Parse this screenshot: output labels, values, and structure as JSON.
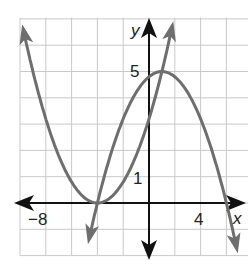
{
  "chart_data": {
    "type": "line",
    "title": "",
    "xlabel": "x",
    "ylabel": "y",
    "xlim": [
      -10,
      7.8
    ],
    "ylim": [
      -2,
      7.2
    ],
    "grid": true,
    "x_grid_step": 2,
    "y_grid_step": 1,
    "tick_labels": {
      "x": [
        {
          "value": -8,
          "label": "−8"
        },
        {
          "value": 4,
          "label": "4"
        }
      ],
      "y": [
        {
          "value": 1,
          "label": "1"
        },
        {
          "value": 5,
          "label": "5"
        }
      ]
    },
    "series": [
      {
        "name": "upward parabola",
        "equation": "y = 0.2(x + 4)^2",
        "vertex": [
          -4,
          0
        ],
        "x": [
          -10,
          -8,
          -6,
          -4,
          -2,
          0,
          2
        ],
        "values": [
          7.2,
          3.2,
          0.8,
          0,
          0.8,
          3.2,
          7.2
        ],
        "color": "#6e6e6e"
      },
      {
        "name": "downward parabola",
        "equation": "y = -0.2(x + 4)(x - 6)",
        "vertex": [
          1,
          5
        ],
        "roots": [
          -4,
          6
        ],
        "x": [
          -4.8,
          -4,
          -2,
          0,
          1,
          2,
          4,
          6,
          7
        ],
        "values": [
          -1.73,
          0,
          3.2,
          4.8,
          5,
          4.8,
          3.2,
          0,
          -2.2
        ],
        "color": "#6e6e6e"
      }
    ]
  },
  "axis_labels": {
    "x": "x",
    "y": "y"
  },
  "ticks": {
    "x_neg8": "−8",
    "x_4": "4",
    "y_1": "1",
    "y_5": "5"
  },
  "colors": {
    "curve": "#6e6e6e",
    "axis": "#111111",
    "grid": "#c9c9c9"
  }
}
